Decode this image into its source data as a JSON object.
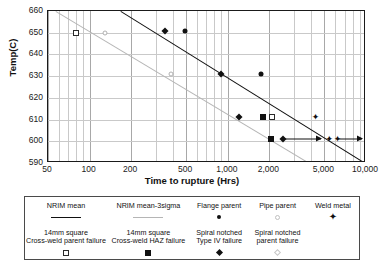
{
  "chart_data": {
    "type": "scatter",
    "title": "",
    "xlabel": "Time to rupture (Hrs)",
    "ylabel": "Temp(C)",
    "xscale": "log",
    "xlim": [
      50,
      10000
    ],
    "ylim": [
      590,
      660
    ],
    "grid": true,
    "xticks": [
      "50",
      "100",
      "200",
      "500",
      "1,000",
      "2,000",
      "5,000",
      "10,000"
    ],
    "xtick_values": [
      50,
      100,
      200,
      500,
      1000,
      2000,
      5000,
      10000
    ],
    "yticks": [
      "590",
      "600",
      "610",
      "620",
      "630",
      "640",
      "650",
      "660"
    ],
    "ytick_values": [
      590,
      600,
      610,
      620,
      630,
      640,
      650,
      660
    ],
    "legend_position": "below-plot",
    "series": [
      {
        "name": "NRIM mean",
        "marker": "line-dark",
        "type": "line",
        "points": [
          [
            170,
            660
          ],
          [
            10000,
            590
          ]
        ]
      },
      {
        "name": "NRIM mean-3sigma",
        "marker": "line-light",
        "type": "line",
        "points": [
          [
            57,
            660
          ],
          [
            3900,
            590
          ]
        ]
      },
      {
        "name": "Flange parent",
        "marker": "filled-circle",
        "points": [
          [
            490,
            651
          ],
          [
            1750,
            631
          ]
        ]
      },
      {
        "name": "Pipe parent",
        "marker": "open-circle",
        "points": [
          [
            130,
            650
          ],
          [
            390,
            631
          ]
        ]
      },
      {
        "name": "Weld metal",
        "marker": "star",
        "points": [
          [
            4300,
            611
          ],
          [
            5400,
            601
          ],
          [
            6200,
            601
          ]
        ]
      },
      {
        "name": "14mm square Cross-weld parent failure",
        "marker": "open-square",
        "points": [
          [
            80,
            650
          ],
          [
            2100,
            611
          ]
        ]
      },
      {
        "name": "14mm square Cross-weld HAZ failure",
        "marker": "filled-square",
        "points": [
          [
            1800,
            611
          ],
          [
            2050,
            601
          ]
        ]
      },
      {
        "name": "Spiral notched Type IV failure",
        "marker": "diamond",
        "points": [
          [
            350,
            651
          ],
          [
            900,
            631
          ],
          [
            1200,
            611
          ],
          [
            2500,
            601
          ]
        ]
      },
      {
        "name": "Spiral notched parent failure",
        "marker": "open-diamond",
        "points": []
      }
    ],
    "runouts": [
      {
        "temp": 601,
        "from": 2500,
        "to": 4700
      },
      {
        "temp": 601,
        "from": 6200,
        "to": 9300
      }
    ],
    "annotations": []
  },
  "axes": {
    "y_title": "Temp(C)",
    "x_title": "Time to rupture (Hrs)",
    "y_ticks": [
      "660",
      "650",
      "640",
      "630",
      "620",
      "610",
      "600",
      "590"
    ],
    "x_ticks": [
      "50",
      "100",
      "200",
      "500",
      "1,000",
      "2,000",
      "5,000",
      "10,000"
    ]
  },
  "legend": {
    "row1": [
      {
        "label": "NRIM mean",
        "symbol": "line-dark"
      },
      {
        "label": "NRIM mean-3sigma",
        "symbol": "line-light"
      },
      {
        "label": "Flange parent",
        "symbol": "filled-circle"
      },
      {
        "label": "Pipe parent",
        "symbol": "open-circle"
      },
      {
        "label": "Weld metal",
        "symbol": "star"
      }
    ],
    "row2": [
      {
        "line1": "14mm square",
        "line2": "Cross-weld parent failure",
        "symbol": "open-square"
      },
      {
        "line1": "14mm square",
        "line2": "Cross-weld HAZ failure",
        "symbol": "filled-square"
      },
      {
        "line1": "Spiral notched",
        "line2": "Type IV failure",
        "symbol": "diamond"
      },
      {
        "line1": "Spiral notched",
        "line2": "parent failure",
        "symbol": "open-diamond"
      },
      {
        "line1": "",
        "line2": "",
        "symbol": "none"
      }
    ]
  },
  "symbols": {
    "star_glyph": "✦"
  },
  "colors": {
    "line_dark": "#111111",
    "line_light": "#b5b5b5",
    "grid": "#c9c9c9",
    "frame": "#1a1a1a",
    "text": "#1a1a1a"
  }
}
